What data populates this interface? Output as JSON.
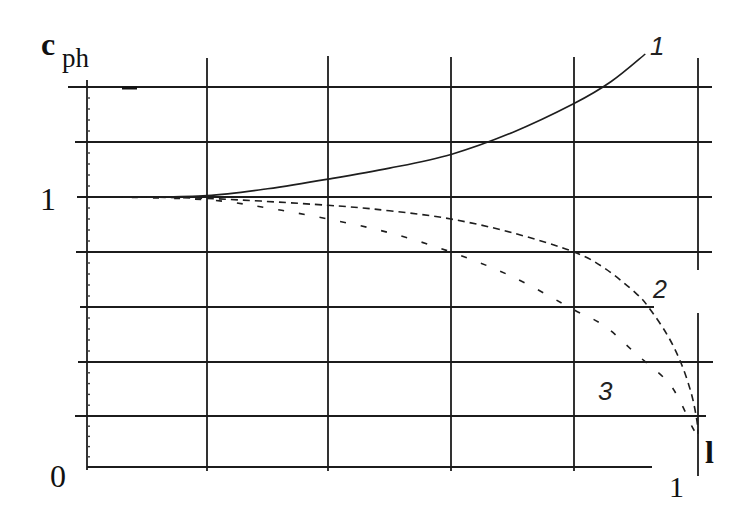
{
  "chart_data": {
    "type": "line",
    "title": "",
    "xlabel": "l",
    "ylabel": "c_ph",
    "ylabel_main": "c",
    "ylabel_sub": "ph",
    "xlim": [
      0,
      1
    ],
    "ylim": [
      0,
      1.5
    ],
    "grid": true,
    "legend": "none (curves annotated inline with italic numbers 1, 2, 3)",
    "x_ticks": [
      {
        "value": 0,
        "label": "0"
      },
      {
        "value": 1,
        "label": "1"
      }
    ],
    "y_ticks": [
      {
        "value": 1,
        "label": "1"
      }
    ],
    "x_gridlines": [
      0,
      0.2,
      0.4,
      0.6,
      0.8,
      1.0
    ],
    "y_gridlines": [
      0,
      0.2,
      0.4,
      0.6,
      0.8,
      1.0,
      1.2,
      1.4
    ],
    "y_minor_tick_step": 0.04,
    "series": [
      {
        "name": "1",
        "style": "solid",
        "x": [
          0.04,
          0.1,
          0.2,
          0.3,
          0.4,
          0.5,
          0.6,
          0.7,
          0.8,
          0.86,
          0.915
        ],
        "y": [
          1.0,
          1.0,
          1.005,
          1.03,
          1.065,
          1.105,
          1.155,
          1.235,
          1.34,
          1.42,
          1.52
        ]
      },
      {
        "name": "2",
        "style": "dashed",
        "x": [
          0.04,
          0.2,
          0.4,
          0.5,
          0.6,
          0.7,
          0.8,
          0.85,
          0.9,
          0.92,
          0.95,
          0.972,
          0.989,
          0.998,
          1.0
        ],
        "y": [
          1.0,
          0.995,
          0.97,
          0.95,
          0.92,
          0.87,
          0.8,
          0.74,
          0.65,
          0.6,
          0.5,
          0.4,
          0.285,
          0.185,
          0.13
        ]
      },
      {
        "name": "3",
        "style": "dashed-sparse",
        "x": [
          0.04,
          0.2,
          0.3,
          0.4,
          0.5,
          0.6,
          0.7,
          0.8,
          0.85,
          0.9,
          0.95,
          0.972,
          0.99,
          1.0
        ],
        "y": [
          1.0,
          0.99,
          0.96,
          0.92,
          0.87,
          0.8,
          0.71,
          0.59,
          0.53,
          0.43,
          0.33,
          0.25,
          0.16,
          0.12
        ]
      }
    ]
  }
}
